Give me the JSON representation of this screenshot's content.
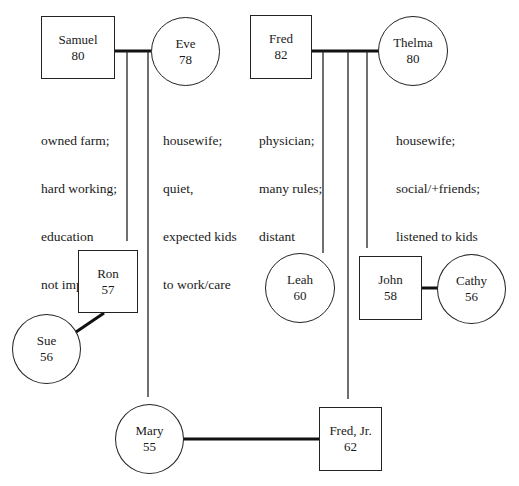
{
  "genogram": {
    "people": {
      "samuel": {
        "name": "Samuel",
        "age": "80",
        "sex": "male"
      },
      "eve": {
        "name": "Eve",
        "age": "78",
        "sex": "female"
      },
      "fred": {
        "name": "Fred",
        "age": "82",
        "sex": "male"
      },
      "thelma": {
        "name": "Thelma",
        "age": "80",
        "sex": "female"
      },
      "ron": {
        "name": "Ron",
        "age": "57",
        "sex": "male"
      },
      "sue": {
        "name": "Sue",
        "age": "56",
        "sex": "female"
      },
      "mary": {
        "name": "Mary",
        "age": "55",
        "sex": "female"
      },
      "fred_jr": {
        "name": "Fred, Jr.",
        "age": "62",
        "sex": "male"
      },
      "leah": {
        "name": "Leah",
        "age": "60",
        "sex": "female"
      },
      "john": {
        "name": "John",
        "age": "58",
        "sex": "male"
      },
      "cathy": {
        "name": "Cathy",
        "age": "56",
        "sex": "female"
      }
    },
    "notes": {
      "samuel": [
        "owned farm;",
        "hard working;",
        "education",
        "not important"
      ],
      "eve": [
        "housewife;",
        "quiet,",
        "expected kids",
        "to work/care"
      ],
      "fred": [
        "physician;",
        "many rules;",
        "distant"
      ],
      "thelma": [
        "housewife;",
        "social/+friends;",
        "listened to kids"
      ]
    },
    "relationships": [
      {
        "type": "marriage",
        "between": [
          "Samuel",
          "Eve"
        ]
      },
      {
        "type": "marriage",
        "between": [
          "Fred",
          "Thelma"
        ]
      },
      {
        "type": "marriage",
        "between": [
          "Ron",
          "Sue"
        ]
      },
      {
        "type": "marriage",
        "between": [
          "John",
          "Cathy"
        ]
      },
      {
        "type": "marriage",
        "between": [
          "Mary",
          "Fred, Jr."
        ]
      },
      {
        "type": "child",
        "parents": [
          "Samuel",
          "Eve"
        ],
        "children": [
          "Ron",
          "Mary"
        ]
      },
      {
        "type": "child",
        "parents": [
          "Fred",
          "Thelma"
        ],
        "children": [
          "Leah",
          "Fred, Jr.",
          "John"
        ]
      }
    ]
  }
}
